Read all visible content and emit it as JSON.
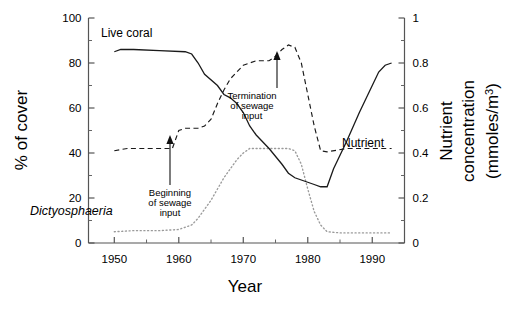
{
  "figure": {
    "xlabel": "Year",
    "ylabel_left": "% of cover",
    "ylabel_right_line1": "Nutrient",
    "ylabel_right_line2": "concentration",
    "ylabel_right_line3": "(mmoles/m",
    "ylabel_right_sup": "3",
    "ylabel_right_line3b": ")"
  },
  "labels": {
    "live_coral": "Live coral",
    "dictyosphaeria": "Dictyosphaeria",
    "nutrient": "Nutrient",
    "ann_begin_1": "Beginning",
    "ann_begin_2": "of sewage",
    "ann_begin_3": "input",
    "ann_term_1": "Termination",
    "ann_term_2": "of sewage",
    "ann_term_3": "input"
  },
  "axes": {
    "x_ticks": [
      "1950",
      "1960",
      "1970",
      "1980",
      "1990"
    ],
    "x_tick_values": [
      1950,
      1960,
      1970,
      1980,
      1990
    ],
    "x_range": [
      1946,
      1995
    ],
    "y_left_ticks": [
      "0",
      "20",
      "40",
      "60",
      "80",
      "100"
    ],
    "y_left_values": [
      0,
      20,
      40,
      60,
      80,
      100
    ],
    "y_left_range": [
      0,
      100
    ],
    "y_right_ticks": [
      "0",
      "0.2",
      "0.4",
      "0.6",
      "0.8",
      "1"
    ],
    "y_right_values": [
      0,
      0.2,
      0.4,
      0.6,
      0.8,
      1
    ],
    "y_right_range": [
      0,
      1
    ]
  },
  "chart_data": {
    "type": "line",
    "title": "",
    "xlabel": "Year",
    "ylabel": "% of cover",
    "ylabel_secondary": "Nutrient concentration (mmoles/m3)",
    "xlim": [
      1946,
      1995
    ],
    "ylim": [
      0,
      100
    ],
    "ylim_secondary": [
      0,
      1
    ],
    "grid": false,
    "legend": "inline-labels",
    "series": [
      {
        "name": "Live coral",
        "axis": "left",
        "unit": "% of cover",
        "style": "solid",
        "color": "#1a1a1a",
        "points": [
          [
            1950,
            85
          ],
          [
            1951,
            86
          ],
          [
            1953,
            86
          ],
          [
            1957,
            85.5
          ],
          [
            1961,
            85
          ],
          [
            1962,
            84
          ],
          [
            1963,
            80
          ],
          [
            1964,
            75
          ],
          [
            1966,
            70
          ],
          [
            1967,
            66
          ],
          [
            1968,
            64.5
          ],
          [
            1969,
            62
          ],
          [
            1970,
            58
          ],
          [
            1971,
            52
          ],
          [
            1972,
            48
          ],
          [
            1974,
            42
          ],
          [
            1976,
            35
          ],
          [
            1977,
            31
          ],
          [
            1978,
            29
          ],
          [
            1980,
            27
          ],
          [
            1981,
            26
          ],
          [
            1982,
            25
          ],
          [
            1983,
            25
          ],
          [
            1984,
            33
          ],
          [
            1986,
            45
          ],
          [
            1988,
            58
          ],
          [
            1990,
            70
          ],
          [
            1991,
            76
          ],
          [
            1992,
            79
          ],
          [
            1993,
            80
          ]
        ]
      },
      {
        "name": "Nutrient",
        "axis": "right",
        "unit": "mmoles/m3",
        "style": "dashed",
        "color": "#1a1a1a",
        "points": [
          [
            1950,
            0.41
          ],
          [
            1952,
            0.42
          ],
          [
            1956,
            0.42
          ],
          [
            1959,
            0.42
          ],
          [
            1960,
            0.5
          ],
          [
            1961,
            0.51
          ],
          [
            1963,
            0.51
          ],
          [
            1964,
            0.52
          ],
          [
            1965,
            0.55
          ],
          [
            1966,
            0.62
          ],
          [
            1967,
            0.68
          ],
          [
            1968,
            0.73
          ],
          [
            1970,
            0.79
          ],
          [
            1972,
            0.81
          ],
          [
            1974,
            0.81
          ],
          [
            1975,
            0.83
          ],
          [
            1976,
            0.86
          ],
          [
            1977,
            0.88
          ],
          [
            1978,
            0.87
          ],
          [
            1979,
            0.8
          ],
          [
            1980,
            0.66
          ],
          [
            1981,
            0.52
          ],
          [
            1982,
            0.41
          ],
          [
            1983,
            0.405
          ],
          [
            1986,
            0.42
          ],
          [
            1989,
            0.42
          ],
          [
            1992,
            0.42
          ],
          [
            1993,
            0.42
          ]
        ]
      },
      {
        "name": "Dictyosphaeria",
        "axis": "left",
        "unit": "% of cover",
        "style": "dotted",
        "color": "#9a9a9a",
        "points": [
          [
            1950,
            5
          ],
          [
            1953,
            5.5
          ],
          [
            1957,
            5.5
          ],
          [
            1960,
            6
          ],
          [
            1962,
            8
          ],
          [
            1963,
            11
          ],
          [
            1964,
            15
          ],
          [
            1965,
            19
          ],
          [
            1966,
            24
          ],
          [
            1967,
            29
          ],
          [
            1968,
            33
          ],
          [
            1969,
            37
          ],
          [
            1970,
            40
          ],
          [
            1971,
            42
          ],
          [
            1973,
            42
          ],
          [
            1975,
            42
          ],
          [
            1977,
            42
          ],
          [
            1978,
            41
          ],
          [
            1979,
            35
          ],
          [
            1980,
            24
          ],
          [
            1981,
            14
          ],
          [
            1982,
            8
          ],
          [
            1983,
            5
          ],
          [
            1985,
            4.5
          ],
          [
            1988,
            4.5
          ],
          [
            1991,
            4.5
          ],
          [
            1993,
            4.5
          ]
        ]
      }
    ],
    "annotations": [
      {
        "text": "Beginning of sewage input",
        "year": 1959,
        "target_value": 41,
        "axis": "right"
      },
      {
        "text": "Termination of sewage input",
        "year": 1977,
        "target_value": 0.88,
        "axis": "right"
      }
    ]
  }
}
